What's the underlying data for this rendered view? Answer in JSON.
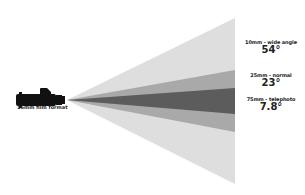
{
  "diagram": {
    "camera": {
      "label": "16mm film format",
      "icon": "film-camera-icon"
    },
    "lenses": [
      {
        "name": "wide",
        "label": "10mm - wide angle",
        "angle": "54°",
        "color": "#dcdcdc"
      },
      {
        "name": "normal",
        "label": "25mm - normal",
        "angle": "23°",
        "color": "#a8a8a8"
      },
      {
        "name": "telephoto",
        "label": "75mm - telephoto",
        "angle": "7.8°",
        "color": "#5a5a5a"
      }
    ]
  }
}
